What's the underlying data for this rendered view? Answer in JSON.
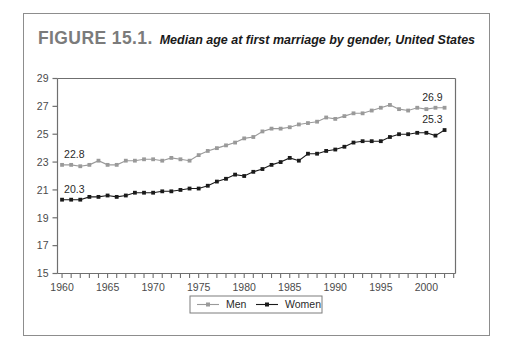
{
  "figure": {
    "number": "FIGURE 15.1.",
    "title": "Median age at first marriage by gender, United States"
  },
  "chart_data": {
    "type": "line",
    "title": "Median age at first marriage by gender, United States",
    "xlabel": "",
    "ylabel": "",
    "xlim": [
      1959.5,
      2003.2
    ],
    "ylim": [
      15,
      29
    ],
    "ytick_labels": [
      "15",
      "17",
      "19",
      "21",
      "23",
      "25",
      "27",
      "29"
    ],
    "yticks": [
      15,
      17,
      19,
      21,
      23,
      25,
      27,
      29
    ],
    "xtick_labels": [
      "1960",
      "1965",
      "1970",
      "1975",
      "1980",
      "1985",
      "1990",
      "1995",
      "2000"
    ],
    "xticks": [
      1960,
      1965,
      1970,
      1975,
      1980,
      1985,
      1990,
      1995,
      2000
    ],
    "x": [
      1960,
      1961,
      1962,
      1963,
      1964,
      1965,
      1966,
      1967,
      1968,
      1969,
      1970,
      1971,
      1972,
      1973,
      1974,
      1975,
      1976,
      1977,
      1978,
      1979,
      1980,
      1981,
      1982,
      1983,
      1984,
      1985,
      1986,
      1987,
      1988,
      1989,
      1990,
      1991,
      1992,
      1993,
      1994,
      1995,
      1996,
      1997,
      1998,
      1999,
      2000,
      2001,
      2002
    ],
    "grid": false,
    "legend_position": "bottom-center",
    "series": [
      {
        "name": "Men",
        "color": "#9a9a9a",
        "marker": "square",
        "values": [
          22.8,
          22.8,
          22.7,
          22.8,
          23.1,
          22.8,
          22.8,
          23.1,
          23.1,
          23.2,
          23.2,
          23.1,
          23.3,
          23.2,
          23.1,
          23.5,
          23.8,
          24.0,
          24.2,
          24.4,
          24.7,
          24.8,
          25.2,
          25.4,
          25.4,
          25.5,
          25.7,
          25.8,
          25.9,
          26.2,
          26.1,
          26.3,
          26.5,
          26.5,
          26.7,
          26.9,
          27.1,
          26.8,
          26.7,
          26.9,
          26.8,
          26.9,
          26.9
        ]
      },
      {
        "name": "Women",
        "color": "#1a1a1a",
        "marker": "square",
        "values": [
          20.3,
          20.3,
          20.3,
          20.5,
          20.5,
          20.6,
          20.5,
          20.6,
          20.8,
          20.8,
          20.8,
          20.9,
          20.9,
          21.0,
          21.1,
          21.1,
          21.3,
          21.6,
          21.8,
          22.1,
          22.0,
          22.3,
          22.5,
          22.8,
          23.0,
          23.3,
          23.1,
          23.6,
          23.6,
          23.8,
          23.9,
          24.1,
          24.4,
          24.5,
          24.5,
          24.5,
          24.8,
          25.0,
          25.0,
          25.1,
          25.1,
          24.9,
          25.3
        ]
      }
    ],
    "annotations": [
      {
        "text": "22.8",
        "series": "Men",
        "x": 1960,
        "value": 22.8
      },
      {
        "text": "20.3",
        "series": "Women",
        "x": 1960,
        "value": 20.3
      },
      {
        "text": "26.9",
        "series": "Men",
        "x": 2002,
        "value": 26.9
      },
      {
        "text": "25.3",
        "series": "Women",
        "x": 2002,
        "value": 25.3
      }
    ]
  },
  "legend": {
    "items": [
      {
        "label": "Men",
        "color": "#9a9a9a"
      },
      {
        "label": "Women",
        "color": "#1a1a1a"
      }
    ]
  }
}
